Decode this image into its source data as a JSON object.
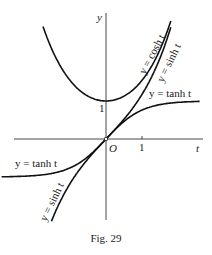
{
  "figure": {
    "caption": "Fig. 29",
    "axes": {
      "x_label": "t",
      "y_label": "y",
      "origin_label": "O",
      "x_tick_label": "1",
      "y_tick_label": "1"
    },
    "curves": [
      {
        "name": "cosh",
        "label": "y = cosh t"
      },
      {
        "name": "sinh",
        "label": "y = sinh t"
      },
      {
        "name": "tanh",
        "label": "y = tanh t"
      }
    ],
    "labels": {
      "cosh_upper": "y = cosh t",
      "sinh_upper": "y = sinh t",
      "tanh_right": "y = tanh t",
      "tanh_left": "y = tanh t",
      "sinh_lower": "y = sinh t"
    },
    "colors": {
      "ink": "#1a1a1a",
      "background": "#ffffff"
    }
  },
  "chart_data": {
    "type": "line",
    "title": "Fig. 29",
    "xlabel": "t",
    "ylabel": "y",
    "xlim": [
      -2.9,
      2.7
    ],
    "ylim": [
      -3.2,
      3.3
    ],
    "series": [
      {
        "name": "y = cosh t",
        "function": "cosh",
        "t_range": [
          -1.75,
          1.8
        ]
      },
      {
        "name": "y = sinh t",
        "function": "sinh",
        "t_range": [
          -1.6,
          1.8
        ]
      },
      {
        "name": "y = tanh t",
        "function": "tanh",
        "t_range": [
          -2.9,
          2.6
        ]
      }
    ],
    "ticks": {
      "x": [
        1
      ],
      "y": [
        1
      ]
    },
    "grid": false,
    "legend": "inline labels along curves"
  }
}
